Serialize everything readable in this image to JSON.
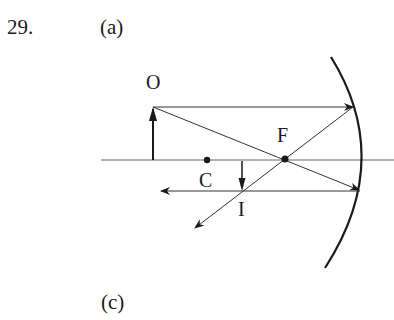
{
  "problem_number": "29.",
  "part_top_label": "(a)",
  "part_bottom_label": "(c)",
  "diagram": {
    "type": "concave-mirror-ray-diagram",
    "labels": {
      "object": "O",
      "focal_point": "F",
      "center_of_curvature": "C",
      "image": "I"
    },
    "colors": {
      "ink": "#1a1a1a",
      "axis": "#555555"
    }
  }
}
